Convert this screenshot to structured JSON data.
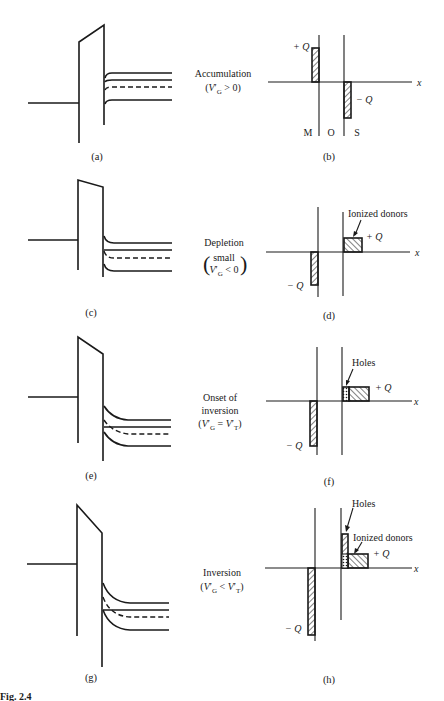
{
  "figure": {
    "panels": [
      {
        "id": "a",
        "label": "(a)",
        "type": "band-diagram",
        "condition": "Accumulation",
        "condition_expr": "(V'G > 0)"
      },
      {
        "id": "b",
        "label": "(b)",
        "type": "charge-distribution",
        "regions": [
          "M",
          "O",
          "S"
        ],
        "annotations": [
          "+Q",
          "−Q"
        ]
      },
      {
        "id": "c",
        "label": "(c)",
        "type": "band-diagram",
        "condition": "Depletion",
        "condition_expr": "(small V'G < 0)"
      },
      {
        "id": "d",
        "label": "(d)",
        "type": "charge-distribution",
        "annotations": [
          "Ionized donors",
          "+Q",
          "−Q"
        ]
      },
      {
        "id": "e",
        "label": "(e)",
        "type": "band-diagram",
        "condition": "Onset of inversion",
        "condition_expr": "(V'G = V'T)"
      },
      {
        "id": "f",
        "label": "(f)",
        "type": "charge-distribution",
        "annotations": [
          "Holes",
          "+Q",
          "−Q"
        ]
      },
      {
        "id": "g",
        "label": "(g)",
        "type": "band-diagram",
        "condition": "Inversion",
        "condition_expr": "(V'G < V'T)"
      },
      {
        "id": "h",
        "label": "(h)",
        "type": "charge-distribution",
        "annotations": [
          "Holes",
          "Ionized donors",
          "+Q",
          "−Q"
        ]
      }
    ]
  },
  "labels": {
    "a": "(a)",
    "b": "(b)",
    "c": "(c)",
    "d": "(d)",
    "e": "(e)",
    "f": "(f)",
    "g": "(g)",
    "h": "(h)",
    "x_axis": "x",
    "plus_q": "+ Q",
    "minus_q": "− Q",
    "metal": "M",
    "oxide": "O",
    "semiconductor": "S",
    "ionized_donors": "Ionized donors",
    "holes": "Holes"
  },
  "conditions": {
    "accumulation": {
      "title": "Accumulation",
      "open": "(",
      "v": "V",
      "prime": "′",
      "sub": "G",
      "rel": " > 0)"
    },
    "depletion": {
      "title": "Depletion",
      "small": "small",
      "v": "V",
      "prime": "′",
      "sub": "G",
      "rel": " < 0"
    },
    "onset": {
      "title1": "Onset of",
      "title2": "inversion",
      "open": "(",
      "v": "V",
      "prime": "′",
      "sub": "G",
      "eq": " = ",
      "v2": "V",
      "prime2": "′",
      "sub2": "T",
      "close": ")"
    },
    "inversion": {
      "title": "Inversion",
      "open": "(",
      "v": "V",
      "prime": "′",
      "sub": "G",
      "lt": " < ",
      "v2": "V",
      "prime2": "′",
      "sub2": "T",
      "close": ")"
    }
  },
  "caption_fragment": "Fig. 2.4"
}
